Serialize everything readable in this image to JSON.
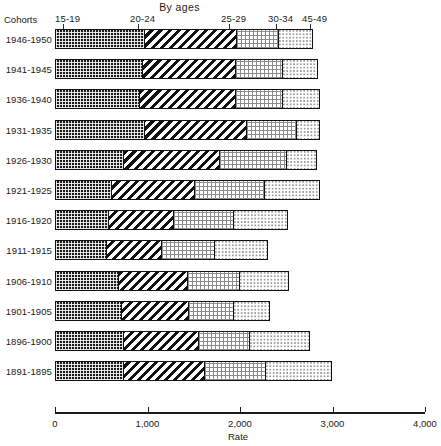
{
  "chart_data": {
    "type": "bar",
    "orientation": "horizontal",
    "stacked": true,
    "title": "By ages",
    "xlabel": "Rate",
    "ylabel": "Cohorts",
    "xlim": [
      0,
      4000
    ],
    "xticks": [
      0,
      1000,
      2000,
      3000,
      4000
    ],
    "xtick_labels": [
      "0",
      "1,000",
      "2,000",
      "3,000",
      "4,000"
    ],
    "grid": false,
    "legend_position": "top-inline",
    "series": [
      {
        "name": "15-19",
        "pattern": "dark-grid"
      },
      {
        "name": "20-24",
        "pattern": "diagonal-hatch"
      },
      {
        "name": "25-29",
        "pattern": "fine-checker"
      },
      {
        "name": "30-34",
        "pattern": "sparse-dots"
      },
      {
        "name": "45-49",
        "pattern": "sparse-dots-light"
      }
    ],
    "categories": [
      "1946-1950",
      "1941-1945",
      "1936-1940",
      "1931-1935",
      "1926-1930",
      "1921-1925",
      "1916-1920",
      "1911-1915",
      "1906-1910",
      "1901-1905",
      "1896-1900",
      "1891-1895"
    ],
    "values": [
      {
        "cohort": "1946-1950",
        "segments": [
          950,
          995,
          455,
          390
        ],
        "total": 2790
      },
      {
        "cohort": "1941-1945",
        "segments": [
          930,
          1010,
          500,
          400
        ],
        "total": 2840
      },
      {
        "cohort": "1936-1940",
        "segments": [
          900,
          1030,
          510,
          430
        ],
        "total": 2870
      },
      {
        "cohort": "1931-1935",
        "segments": [
          950,
          1100,
          540,
          270
        ],
        "total": 2860
      },
      {
        "cohort": "1926-1930",
        "segments": [
          725,
          1040,
          725,
          345
        ],
        "total": 2835
      },
      {
        "cohort": "1921-1925",
        "segments": [
          595,
          900,
          755,
          615
        ],
        "total": 2865
      },
      {
        "cohort": "1916-1920",
        "segments": [
          560,
          705,
          650,
          605
        ],
        "total": 2520
      },
      {
        "cohort": "1911-1915",
        "segments": [
          540,
          595,
          575,
          595
        ],
        "total": 2305
      },
      {
        "cohort": "1906-1910",
        "segments": [
          670,
          745,
          560,
          555
        ],
        "total": 2530
      },
      {
        "cohort": "1901-1905",
        "segments": [
          700,
          725,
          490,
          410
        ],
        "total": 2325
      },
      {
        "cohort": "1896-1900",
        "segments": [
          725,
          810,
          550,
          675
        ],
        "total": 2760
      },
      {
        "cohort": "1891-1895",
        "segments": [
          725,
          875,
          660,
          735
        ],
        "total": 2995
      }
    ]
  },
  "header": {
    "cohorts_label": "Cohorts",
    "title": "By ages",
    "age_groups": [
      {
        "label": "15-19",
        "x": 55
      },
      {
        "label": "20-24",
        "x": 130
      },
      {
        "label": "25-29",
        "x": 221
      },
      {
        "label": "30-34",
        "x": 268
      },
      {
        "label": "45-49",
        "x": 302
      }
    ]
  },
  "axis": {
    "title": "Rate",
    "ticks": [
      {
        "label": "0",
        "value": 0
      },
      {
        "label": "1,000",
        "value": 1000
      },
      {
        "label": "2,000",
        "value": 2000
      },
      {
        "label": "3,000",
        "value": 3000
      },
      {
        "label": "4,000",
        "value": 4000
      }
    ]
  },
  "colors": {
    "ink": "#1a1a1a",
    "dark_fill": "#1b1b1b",
    "mid_gray": "#8d8d8d",
    "light_gray": "#9a9a9a",
    "background": "#ffffff"
  }
}
